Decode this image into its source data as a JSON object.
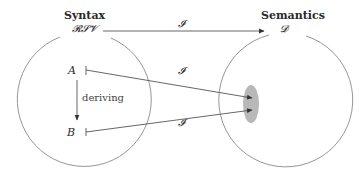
{
  "diagram": {
    "left": {
      "title": "Syntax",
      "set_label": "𝓡𝓢𝓥",
      "node_a": "A",
      "node_b": "B",
      "edge_label": "deriving"
    },
    "right": {
      "title": "Semantics",
      "set_label": "𝓓"
    },
    "mappings": {
      "top": "𝓘",
      "a_to_region": "𝓘",
      "b_to_region": "𝓘"
    },
    "colors": {
      "line": "#6e6e6e",
      "circle": "#8a8a8a",
      "region": "#b8b8b8",
      "text": "#2a2a2a"
    }
  }
}
